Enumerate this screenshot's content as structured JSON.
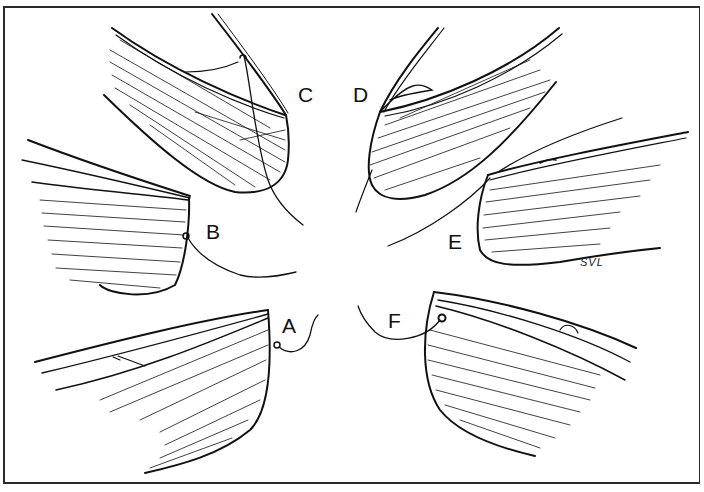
{
  "figure": {
    "labels": [
      {
        "id": "A",
        "text": "A",
        "x": 282,
        "y": 315
      },
      {
        "id": "B",
        "text": "B",
        "x": 206,
        "y": 221
      },
      {
        "id": "C",
        "text": "C",
        "x": 298,
        "y": 84
      },
      {
        "id": "D",
        "text": "D",
        "x": 353,
        "y": 84
      },
      {
        "id": "E",
        "text": "E",
        "x": 448,
        "y": 231
      },
      {
        "id": "F",
        "text": "F",
        "x": 388,
        "y": 310
      }
    ],
    "signature": "SVL",
    "colors": {
      "ink": "#111111",
      "paper": "#ffffff",
      "frame": "#2a2a2a"
    }
  }
}
